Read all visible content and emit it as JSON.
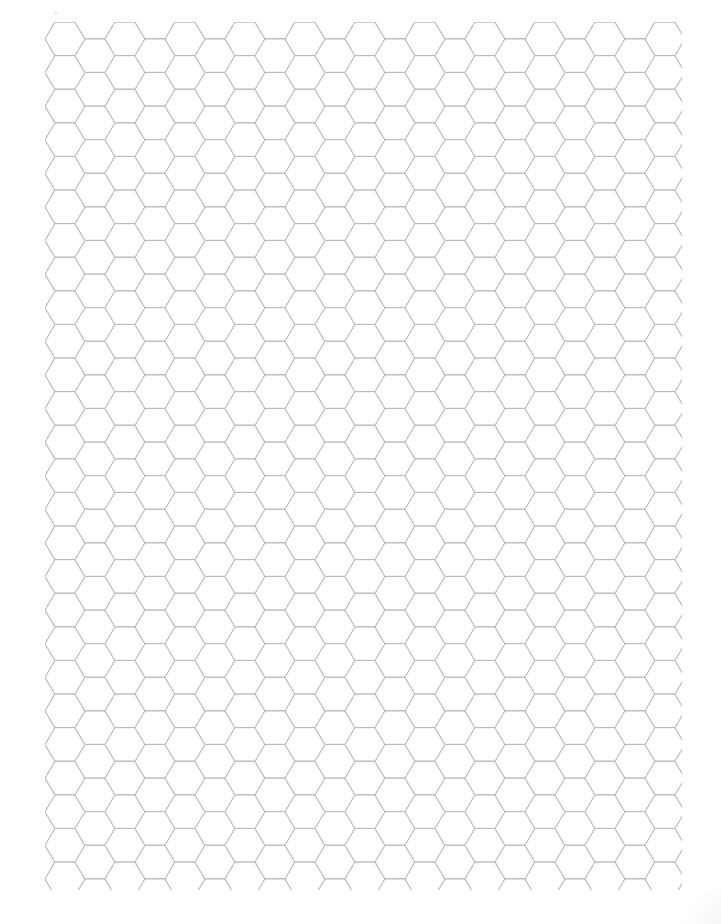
{
  "document": {
    "type": "hexagon-graph-paper",
    "title": "Hexagon Graph Paper",
    "page_width": 721,
    "page_height": 924,
    "background_color": "#fefefe",
    "orientation": "portrait"
  },
  "grid": {
    "name": "hexagonal-grid",
    "cell_shape": "hexagon",
    "hex_orientation": "flat-top",
    "line_color": "#b9b9bc",
    "line_width": 0.9,
    "column_pitch": 40,
    "row_pitch": 33.6,
    "hex_width": 40,
    "hex_height": 33.6,
    "column_offset": 16.8,
    "columns": 17,
    "rows": 27,
    "area": {
      "left": 45,
      "top": 22,
      "right": 682,
      "bottom": 890,
      "width": 637,
      "height": 868
    }
  },
  "margins": {
    "left": 45,
    "top": 22,
    "right": 39,
    "bottom": 34
  },
  "artifacts": {
    "scan_speck": {
      "name": "scan-speck",
      "x": 53,
      "y": 11
    },
    "corner_shade": {
      "name": "corner-shade"
    }
  }
}
